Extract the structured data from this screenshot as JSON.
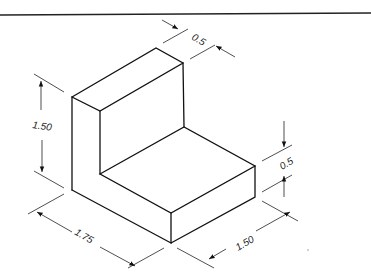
{
  "diagram": {
    "type": "isometric-drawing",
    "dimensions": {
      "wall_thickness": "0.5",
      "height": "1.50",
      "base_thickness": "0.5",
      "length": "1.75",
      "depth": "1.50"
    },
    "colors": {
      "line": "#111111",
      "background": "#ffffff"
    }
  }
}
